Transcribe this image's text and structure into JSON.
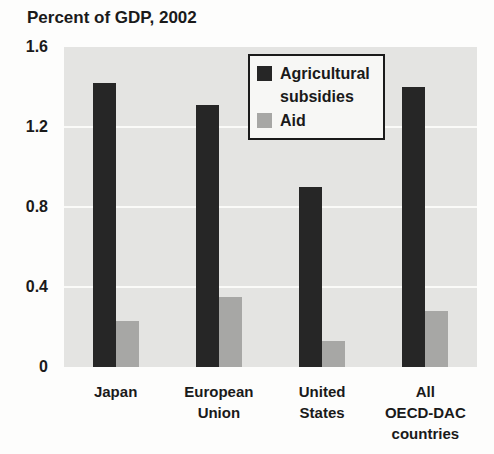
{
  "title": "Percent of GDP, 2002",
  "chart_data": {
    "type": "bar",
    "title": "Percent of GDP, 2002",
    "categories": [
      "Japan",
      "European Union",
      "United States",
      "All OECD-DAC countries"
    ],
    "category_lines": [
      [
        "Japan"
      ],
      [
        "European",
        "Union"
      ],
      [
        "United",
        "States"
      ],
      [
        "All",
        "OECD-DAC",
        "countries"
      ]
    ],
    "series": [
      {
        "name": "Agricultural subsidies",
        "color": "#262626",
        "values": [
          1.42,
          1.31,
          0.9,
          1.4
        ]
      },
      {
        "name": "Aid",
        "color": "#a7a7a5",
        "values": [
          0.23,
          0.35,
          0.13,
          0.28
        ]
      }
    ],
    "xlabel": "",
    "ylabel": "Percent of GDP",
    "ylim": [
      0,
      1.6
    ],
    "ytick_labels": [
      "1.6",
      "1.2",
      "0.8",
      "0.4",
      "0"
    ],
    "ytick_values": [
      1.6,
      1.2,
      0.8,
      0.4,
      0
    ],
    "grid": true,
    "gridline_values": [
      0.4,
      0.8,
      1.2
    ],
    "legend_position": "inside-top-center",
    "plot_background": "#e4e4e2",
    "gridline_color": "#fafaf8"
  },
  "legend": {
    "items": [
      {
        "label": "Agricultural subsidies",
        "swatch_color": "#262626"
      },
      {
        "label": "Aid",
        "swatch_color": "#a7a7a5"
      }
    ]
  },
  "colors": {
    "bar_dark": "#262626",
    "bar_gray": "#a7a7a5",
    "plot_bg": "#e4e4e2",
    "grid": "#fafaf8",
    "text": "#1a1a1a",
    "legend_bg": "#f7f7f5",
    "legend_border": "#1a1a1a",
    "page_bg": "#fdfdfc"
  }
}
